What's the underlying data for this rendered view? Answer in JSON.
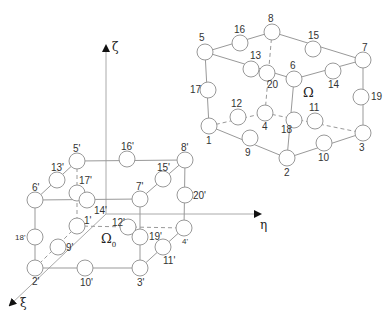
{
  "diagram": {
    "axes": {
      "zeta": {
        "label": "ζ"
      },
      "eta": {
        "label": "η"
      },
      "xi": {
        "label": "ξ"
      }
    },
    "physical_element": {
      "label": "Ω",
      "nodes": {
        "1": "1",
        "2": "2",
        "3": "3",
        "4": "4",
        "5": "5",
        "6": "6",
        "7": "7",
        "8": "8",
        "9": "9",
        "10": "10",
        "11": "11",
        "12": "12",
        "13": "13",
        "14": "14",
        "15": "15",
        "16": "16",
        "17": "17",
        "18": "18",
        "19": "19",
        "20": "20"
      }
    },
    "reference_element": {
      "label": "Ω",
      "subscript": "0",
      "nodes": {
        "1": "1'",
        "2": "2'",
        "3": "3'",
        "4": "4'",
        "5": "5'",
        "6": "6'",
        "7": "7'",
        "8": "8'",
        "9": "9'",
        "10": "10'",
        "11": "11'",
        "12": "12'",
        "13": "13'",
        "14": "14'",
        "15": "15'",
        "16": "16'",
        "17": "17'",
        "18": "18'",
        "19": "19'",
        "20": "20'"
      }
    }
  }
}
